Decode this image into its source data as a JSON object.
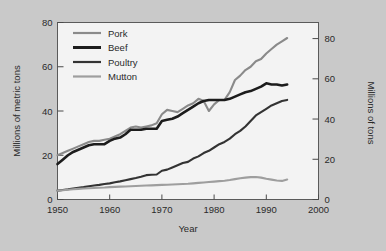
{
  "chart_data": {
    "type": "line",
    "title": "",
    "xlabel": "Year",
    "ylabel": "Millions of metric tons",
    "ylabel_right": "Millions of tons",
    "xlim": [
      1950,
      2000
    ],
    "ylim": [
      0,
      80
    ],
    "ylim_right": [
      0,
      88
    ],
    "xticks": [
      1950,
      1960,
      1970,
      1980,
      1990,
      2000
    ],
    "xtick_labels": [
      "1950",
      "1960",
      "1970",
      "1980",
      "1990",
      "2000"
    ],
    "yticks": [
      0,
      20,
      40,
      60,
      80
    ],
    "ytick_labels": [
      "0",
      "20",
      "40",
      "60",
      "80"
    ],
    "yticks_right": [
      0,
      20,
      40,
      60,
      80
    ],
    "ytick_labels_right": [
      "0",
      "20",
      "40",
      "60",
      "80"
    ],
    "grid": false,
    "legend_position": "upper-left-inside",
    "background": "#c9c9c9",
    "plot_background": "#f3f3f3",
    "series": [
      {
        "name": "Pork",
        "color": "#8a8a8a",
        "width": 2.1,
        "x": [
          1950,
          1951,
          1952,
          1953,
          1954,
          1955,
          1956,
          1957,
          1958,
          1959,
          1960,
          1961,
          1962,
          1963,
          1964,
          1965,
          1966,
          1967,
          1968,
          1969,
          1970,
          1971,
          1972,
          1973,
          1974,
          1975,
          1976,
          1977,
          1978,
          1979,
          1980,
          1981,
          1982,
          1983,
          1984,
          1985,
          1986,
          1987,
          1988,
          1989,
          1990,
          1991,
          1992,
          1993,
          1994
        ],
        "values": [
          20.0,
          21.0,
          22.0,
          23.0,
          24.0,
          25.0,
          26.0,
          26.5,
          26.5,
          27.0,
          27.5,
          28.5,
          29.5,
          31.0,
          32.5,
          33.0,
          32.5,
          33.0,
          33.5,
          34.5,
          38.5,
          40.5,
          40.0,
          39.5,
          41.0,
          42.5,
          43.5,
          45.5,
          44.5,
          40.0,
          43.0,
          45.0,
          45.0,
          48.5,
          54.0,
          56.0,
          58.5,
          60.0,
          62.5,
          63.5,
          66.0,
          68.0,
          70.0,
          71.5,
          73.0
        ]
      },
      {
        "name": "Beef",
        "color": "#1c1c1c",
        "width": 2.6,
        "x": [
          1950,
          1951,
          1952,
          1953,
          1954,
          1955,
          1956,
          1957,
          1958,
          1959,
          1960,
          1961,
          1962,
          1963,
          1964,
          1965,
          1966,
          1967,
          1968,
          1969,
          1970,
          1971,
          1972,
          1973,
          1974,
          1975,
          1976,
          1977,
          1978,
          1979,
          1980,
          1981,
          1982,
          1983,
          1984,
          1985,
          1986,
          1987,
          1988,
          1989,
          1990,
          1991,
          1992,
          1993,
          1994
        ],
        "values": [
          16.0,
          18.0,
          20.0,
          21.5,
          22.5,
          23.5,
          24.5,
          25.0,
          25.0,
          25.0,
          26.5,
          27.5,
          28.0,
          29.5,
          31.5,
          31.5,
          31.5,
          32.0,
          32.0,
          32.0,
          35.5,
          36.0,
          36.5,
          37.5,
          39.0,
          40.5,
          42.0,
          43.5,
          44.5,
          45.0,
          45.0,
          45.0,
          45.0,
          45.5,
          46.5,
          47.5,
          48.5,
          49.0,
          50.0,
          51.0,
          52.5,
          52.0,
          52.0,
          51.5,
          52.0
        ]
      },
      {
        "name": "Poultry",
        "color": "#333333",
        "width": 2.1,
        "x": [
          1950,
          1951,
          1952,
          1953,
          1954,
          1955,
          1956,
          1957,
          1958,
          1959,
          1960,
          1961,
          1962,
          1963,
          1964,
          1965,
          1966,
          1967,
          1968,
          1969,
          1970,
          1971,
          1972,
          1973,
          1974,
          1975,
          1976,
          1977,
          1978,
          1979,
          1980,
          1981,
          1982,
          1983,
          1984,
          1985,
          1986,
          1987,
          1988,
          1989,
          1990,
          1991,
          1992,
          1993,
          1994
        ],
        "values": [
          4.0,
          4.3,
          4.6,
          5.0,
          5.3,
          5.6,
          6.0,
          6.3,
          6.6,
          7.0,
          7.3,
          7.8,
          8.2,
          8.7,
          9.2,
          9.7,
          10.3,
          11.0,
          11.2,
          11.3,
          13.0,
          13.5,
          14.5,
          15.5,
          16.5,
          17.0,
          18.5,
          19.5,
          21.0,
          22.0,
          23.5,
          25.0,
          26.0,
          27.5,
          29.5,
          31.0,
          33.0,
          35.5,
          38.0,
          39.5,
          41.0,
          42.5,
          43.5,
          44.5,
          45.0
        ]
      },
      {
        "name": "Mutton",
        "color": "#9e9e9e",
        "width": 2.1,
        "x": [
          1950,
          1951,
          1952,
          1953,
          1954,
          1955,
          1956,
          1957,
          1958,
          1959,
          1960,
          1961,
          1962,
          1963,
          1964,
          1965,
          1966,
          1967,
          1968,
          1969,
          1970,
          1971,
          1972,
          1973,
          1974,
          1975,
          1976,
          1977,
          1978,
          1979,
          1980,
          1981,
          1982,
          1983,
          1984,
          1985,
          1986,
          1987,
          1988,
          1989,
          1990,
          1991,
          1992,
          1993,
          1994
        ],
        "values": [
          4.0,
          4.2,
          4.4,
          4.6,
          4.8,
          5.0,
          5.1,
          5.2,
          5.3,
          5.4,
          5.6,
          5.7,
          5.8,
          5.9,
          6.0,
          6.1,
          6.2,
          6.3,
          6.4,
          6.5,
          6.6,
          6.7,
          6.8,
          6.9,
          7.0,
          7.1,
          7.3,
          7.5,
          7.7,
          7.9,
          8.1,
          8.3,
          8.5,
          8.8,
          9.2,
          9.6,
          9.9,
          10.1,
          10.2,
          9.9,
          9.4,
          9.0,
          8.6,
          8.4,
          9.0
        ]
      }
    ],
    "legend_entries": [
      {
        "label": "Pork",
        "color": "#8a8a8a"
      },
      {
        "label": "Beef",
        "color": "#1c1c1c"
      },
      {
        "label": "Poultry",
        "color": "#333333"
      },
      {
        "label": "Mutton",
        "color": "#9e9e9e"
      }
    ]
  }
}
